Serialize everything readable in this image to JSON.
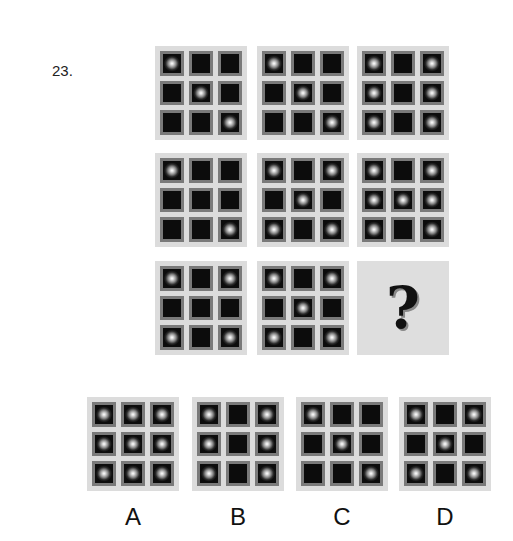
{
  "question": {
    "number": "23.",
    "matrix": [
      [
        {
          "dots": [
            1,
            0,
            0,
            0,
            1,
            0,
            0,
            0,
            1
          ]
        },
        {
          "dots": [
            1,
            0,
            0,
            0,
            1,
            0,
            0,
            0,
            1
          ]
        },
        {
          "dots": [
            1,
            0,
            1,
            1,
            0,
            1,
            1,
            0,
            1
          ]
        }
      ],
      [
        {
          "dots": [
            1,
            0,
            0,
            0,
            0,
            0,
            0,
            0,
            1
          ]
        },
        {
          "dots": [
            1,
            0,
            1,
            0,
            1,
            0,
            1,
            0,
            1
          ]
        },
        {
          "dots": [
            1,
            0,
            1,
            1,
            1,
            1,
            1,
            0,
            1
          ]
        }
      ],
      [
        {
          "dots": [
            1,
            0,
            1,
            0,
            0,
            0,
            1,
            0,
            1
          ]
        },
        {
          "dots": [
            1,
            0,
            1,
            0,
            1,
            0,
            1,
            0,
            1
          ]
        },
        {
          "missing": true,
          "symbol": "?"
        }
      ]
    ],
    "options": [
      {
        "label": "A",
        "dots": [
          1,
          1,
          1,
          1,
          1,
          1,
          1,
          1,
          1
        ]
      },
      {
        "label": "B",
        "dots": [
          1,
          0,
          1,
          1,
          0,
          1,
          1,
          0,
          1
        ]
      },
      {
        "label": "C",
        "dots": [
          1,
          0,
          0,
          0,
          1,
          0,
          0,
          0,
          1
        ]
      },
      {
        "label": "D",
        "dots": [
          1,
          0,
          1,
          0,
          1,
          0,
          1,
          0,
          1
        ]
      }
    ]
  }
}
